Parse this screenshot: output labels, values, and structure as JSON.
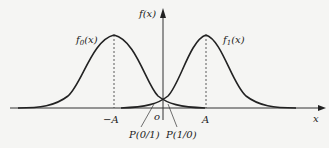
{
  "diagram": {
    "axis_labels": {
      "y": "f(x)",
      "x": "x",
      "origin": "o"
    },
    "curves": [
      {
        "name": "f0",
        "label": "f0(x)",
        "label_main": "f",
        "label_sub": "0",
        "label_arg": "(x)",
        "mean": "-A"
      },
      {
        "name": "f1",
        "label": "f1(x)",
        "label_main": "f",
        "label_sub": "1",
        "label_arg": "(x)",
        "mean": "A"
      }
    ],
    "tick_labels": {
      "neg_a": "−A",
      "pos_a": "A"
    },
    "annotations": {
      "p01": "P(0/1)",
      "p10": "P(1/0)"
    },
    "colors": {
      "line": "#222222",
      "background": "#f5f5f3"
    }
  }
}
